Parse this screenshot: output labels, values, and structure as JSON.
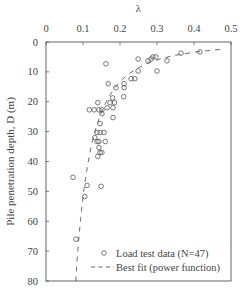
{
  "chart_data": {
    "type": "scatter",
    "title": "",
    "xlabel": "λ",
    "ylabel": "Pile penetration depth, D (m)",
    "xlim": [
      0,
      0.5
    ],
    "ylim": [
      0,
      80
    ],
    "y_inverted": true,
    "x_axis_position": "top",
    "x_ticks": [
      "0",
      "0.1",
      "0.2",
      "0.3",
      "0.4",
      "0.5"
    ],
    "y_ticks": [
      "0",
      "10",
      "20",
      "30",
      "40",
      "50",
      "60",
      "70",
      "80"
    ],
    "grid": false,
    "legend_position": "lower right",
    "series": [
      {
        "name": "Load test data (N=47)",
        "marker": "open-circle",
        "points": [
          [
            0.416,
            3.3
          ],
          [
            0.365,
            3.7
          ],
          [
            0.327,
            6.3
          ],
          [
            0.297,
            5.0
          ],
          [
            0.289,
            5.0
          ],
          [
            0.284,
            5.7
          ],
          [
            0.276,
            6.3
          ],
          [
            0.249,
            5.7
          ],
          [
            0.162,
            7.3
          ],
          [
            0.3,
            9.7
          ],
          [
            0.249,
            9.7
          ],
          [
            0.24,
            12.3
          ],
          [
            0.23,
            12.3
          ],
          [
            0.211,
            14.0
          ],
          [
            0.168,
            14.0
          ],
          [
            0.189,
            15.3
          ],
          [
            0.211,
            15.3
          ],
          [
            0.18,
            18.7
          ],
          [
            0.21,
            18.3
          ],
          [
            0.14,
            20.3
          ],
          [
            0.173,
            20.3
          ],
          [
            0.185,
            20.3
          ],
          [
            0.117,
            22.7
          ],
          [
            0.13,
            22.7
          ],
          [
            0.143,
            22.7
          ],
          [
            0.151,
            22.7
          ],
          [
            0.165,
            22.0
          ],
          [
            0.181,
            22.0
          ],
          [
            0.151,
            24.0
          ],
          [
            0.181,
            25.3
          ],
          [
            0.146,
            27.3
          ],
          [
            0.138,
            30.3
          ],
          [
            0.146,
            30.3
          ],
          [
            0.157,
            30.3
          ],
          [
            0.132,
            32.0
          ],
          [
            0.138,
            33.3
          ],
          [
            0.143,
            33.3
          ],
          [
            0.16,
            33.3
          ],
          [
            0.143,
            35.3
          ],
          [
            0.146,
            37.0
          ],
          [
            0.151,
            37.0
          ],
          [
            0.14,
            38.3
          ],
          [
            0.073,
            45.3
          ],
          [
            0.111,
            48.0
          ],
          [
            0.149,
            48.3
          ],
          [
            0.105,
            51.7
          ],
          [
            0.081,
            66.0
          ]
        ]
      },
      {
        "name": "Best fit (power function)",
        "style": "dashed",
        "equation_form": "λ = a·D^b",
        "a": 0.75,
        "b": -0.51
      }
    ]
  },
  "legend": {
    "data_label": "Load test data (N=47)",
    "fit_label": "Best fit (power function)"
  }
}
